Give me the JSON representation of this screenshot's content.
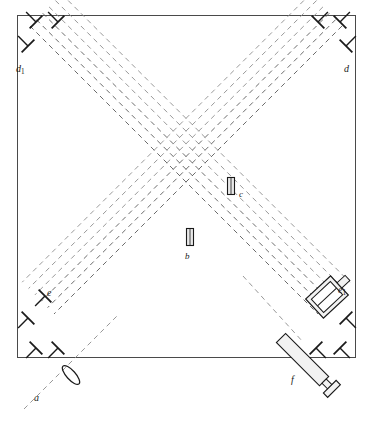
{
  "figure": {
    "kind": "optical-interferometer-schematic",
    "frame": {
      "x": 17,
      "y": 15,
      "width": 338,
      "height": 342,
      "stroke": "#4a4a4a",
      "fill": "#ffffff",
      "stroke_width": 1
    },
    "colors": {
      "ray": "#8c8c8c",
      "ray_dark": "#5a5a5a",
      "ink": "#1a1a1a",
      "frame": "#4a4a4a",
      "component_fill": "#f2f2f2",
      "plate_fill": "#e8e8e8"
    },
    "labels": [
      {
        "id": "a",
        "text": "a",
        "sub": "",
        "x": 34,
        "y": 393,
        "size": 10,
        "role": "incoming-beam"
      },
      {
        "id": "b",
        "text": "b",
        "sub": "",
        "x": 185,
        "y": 252,
        "size": 9,
        "role": "beam-splitter-plate"
      },
      {
        "id": "c",
        "text": "c",
        "sub": "",
        "x": 239,
        "y": 190,
        "size": 9,
        "role": "compensator-plate"
      },
      {
        "id": "d",
        "text": "d",
        "sub": "",
        "x": 344,
        "y": 64,
        "size": 10,
        "role": "mirror-group-top-right"
      },
      {
        "id": "d1",
        "text": "d",
        "sub": "1",
        "x": 16,
        "y": 64,
        "size": 10,
        "role": "mirror-group-top-left"
      },
      {
        "id": "e",
        "text": "e",
        "sub": "",
        "x": 47,
        "y": 288,
        "size": 10,
        "role": "mirror-left"
      },
      {
        "id": "e1",
        "text": "e",
        "sub": "1",
        "x": 338,
        "y": 285,
        "size": 10,
        "role": "adjustable-mirror-mount"
      },
      {
        "id": "f",
        "text": "f",
        "sub": "",
        "x": 291,
        "y": 375,
        "size": 10,
        "role": "observing-telescope"
      }
    ],
    "components": {
      "plate_b": {
        "cx": 190,
        "cy": 237,
        "w": 7,
        "h": 17,
        "angle": 0,
        "name": "beam-splitter-plate-b"
      },
      "plate_c": {
        "cx": 231,
        "cy": 186,
        "w": 7,
        "h": 17,
        "angle": 0,
        "name": "compensator-plate-c"
      },
      "lens_a": {
        "cx": 71,
        "cy": 375,
        "rx": 4.5,
        "ry": 12,
        "angle": -42,
        "name": "collimating-lens"
      },
      "telescope_f": {
        "x1": 281,
        "y1": 338,
        "x2": 334,
        "y2": 391,
        "body_w": 13,
        "name": "telescope-f"
      },
      "mount_e1": {
        "cx": 327,
        "cy": 297,
        "w": 34,
        "h": 26,
        "angle": -43,
        "name": "micrometer-mirror-mount-e1"
      }
    },
    "mirrors": {
      "top_left": [
        {
          "x": 36,
          "y": 22
        },
        {
          "x": 58,
          "y": 22
        },
        {
          "x": 28,
          "y": 46
        }
      ],
      "top_right": [
        {
          "x": 318,
          "y": 22
        },
        {
          "x": 340,
          "y": 22
        },
        {
          "x": 346,
          "y": 46
        }
      ],
      "bottom_left": [
        {
          "x": 28,
          "y": 318
        },
        {
          "x": 36,
          "y": 348
        },
        {
          "x": 58,
          "y": 348
        }
      ],
      "bottom_right": [
        {
          "x": 316,
          "y": 348
        },
        {
          "x": 340,
          "y": 348
        },
        {
          "x": 346,
          "y": 318
        }
      ],
      "left_single": [
        {
          "x": 45,
          "y": 296
        }
      ],
      "note": "T-shaped mirror mounts attached to the frame interior"
    },
    "beams": {
      "diag_down_right": {
        "description": "Dashed ray bundle running from upper-left to lower-right",
        "count": 6,
        "offsets": [
          0,
          9,
          18,
          27,
          36,
          45
        ]
      },
      "diag_down_left": {
        "description": "Dashed ray bundle running from upper-right to lower-left",
        "count": 6,
        "offsets": [
          0,
          9,
          18,
          27,
          36,
          45
        ]
      },
      "entry_ray": {
        "from": {
          "x": 24,
          "y": 409
        },
        "to": {
          "x": 118,
          "y": 315
        },
        "description": "incoming beam a through lens"
      },
      "exit_ray": {
        "from": {
          "x": 243,
          "y": 276
        },
        "to": {
          "x": 303,
          "y": 342
        },
        "description": "beam toward telescope f"
      },
      "dash": "5 4",
      "stroke_width": 0.9
    }
  }
}
